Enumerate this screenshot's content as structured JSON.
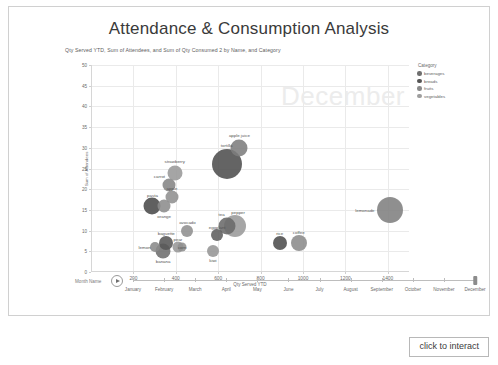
{
  "report": {
    "title": "Attendance & Consumption Analysis",
    "subtitle": "Qty Served YTD, Sum of Attendees, and Sum of Qty Consumed 2 by Name, and Category",
    "click_to_interact_label": "click to interact",
    "watermark": "December"
  },
  "legend": {
    "title": "Category",
    "position": "right",
    "items": [
      {
        "label": "beverages",
        "color": "#6f6f6f"
      },
      {
        "label": "breads",
        "color": "#555555"
      },
      {
        "label": "fruits",
        "color": "#8a8a8a"
      },
      {
        "label": "vegetables",
        "color": "#9e9e9e"
      }
    ]
  },
  "play_axis": {
    "field_label": "Month Name",
    "play_icon": "play-icon",
    "selected": "December",
    "months": [
      "January",
      "February",
      "March",
      "April",
      "May",
      "June",
      "July",
      "August",
      "September",
      "October",
      "November",
      "December"
    ]
  },
  "chart_data": {
    "type": "scatter",
    "title": "Attendance & Consumption Analysis",
    "subtitle": "Qty Served YTD, Sum of Attendees, and Sum of Qty Consumed 2 by Name, and Category",
    "xlabel": "Qty Served YTD",
    "ylabel": "Sum of Attendees",
    "size_label": "Sum of Qty Consumed 2",
    "xlim": [
      0,
      1500
    ],
    "ylim": [
      0,
      50
    ],
    "xticks": [
      200,
      400,
      600,
      800,
      1000,
      1200,
      1400
    ],
    "yticks": [
      0,
      5,
      10,
      15,
      20,
      25,
      30,
      35,
      40,
      45,
      50
    ],
    "grid": true,
    "legend_position": "right",
    "points": [
      {
        "name": "apple juice",
        "category": "beverages",
        "x": 700,
        "y": 30,
        "size": 17,
        "color": "#7d7d7d",
        "label_dx": 0,
        "label_dy": -13
      },
      {
        "name": "tortilla",
        "category": "breads",
        "x": 640,
        "y": 26,
        "size": 30,
        "color": "#4e4e4e",
        "label_dx": 0,
        "label_dy": -19
      },
      {
        "name": "strawberry",
        "category": "fruits",
        "x": 395,
        "y": 24,
        "size": 15,
        "color": "#999999",
        "label_dx": 0,
        "label_dy": -12
      },
      {
        "name": "carrot",
        "category": "vegetables",
        "x": 370,
        "y": 21,
        "size": 13,
        "color": "#858585",
        "label_dx": -10,
        "label_dy": -9
      },
      {
        "name": "apple",
        "category": "fruits",
        "x": 382,
        "y": 18,
        "size": 13,
        "color": "#8f8f8f",
        "label_dx": 0,
        "label_dy": -9
      },
      {
        "name": "pasta",
        "category": "breads",
        "x": 290,
        "y": 16,
        "size": 17,
        "color": "#4a4a4a",
        "label_dx": 0,
        "label_dy": -11
      },
      {
        "name": "orange",
        "category": "fruits",
        "x": 345,
        "y": 16,
        "size": 13,
        "color": "#8c8c8c",
        "label_dx": 0,
        "label_dy": 10
      },
      {
        "name": "lemonade",
        "category": "beverages",
        "x": 1410,
        "y": 15,
        "size": 26,
        "color": "#808080",
        "label_dx": -25,
        "label_dy": 0
      },
      {
        "name": "pepper",
        "category": "vegetables",
        "x": 680,
        "y": 11,
        "size": 22,
        "color": "#9a9a9a",
        "label_dx": 3,
        "label_dy": -14
      },
      {
        "name": "tea",
        "category": "beverages",
        "x": 640,
        "y": 11,
        "size": 17,
        "color": "#6a6a6a",
        "label_dx": -5,
        "label_dy": -12
      },
      {
        "name": "avocado",
        "category": "vegetables",
        "x": 455,
        "y": 10,
        "size": 12,
        "color": "#909090",
        "label_dx": 0,
        "label_dy": -9
      },
      {
        "name": "eggplant",
        "category": "vegetables",
        "x": 595,
        "y": 9,
        "size": 12,
        "color": "#5e5e5e",
        "label_dx": 0,
        "label_dy": -8
      },
      {
        "name": "rice",
        "category": "breads",
        "x": 890,
        "y": 7,
        "size": 14,
        "color": "#4d4d4d",
        "label_dx": 0,
        "label_dy": -10
      },
      {
        "name": "coffee",
        "category": "beverages",
        "x": 980,
        "y": 7,
        "size": 16,
        "color": "#8b8b8b",
        "label_dx": 0,
        "label_dy": -11
      },
      {
        "name": "baguette",
        "category": "breads",
        "x": 355,
        "y": 7,
        "size": 14,
        "color": "#575757",
        "label_dx": 0,
        "label_dy": -10
      },
      {
        "name": "pear",
        "category": "fruits",
        "x": 410,
        "y": 6,
        "size": 11,
        "color": "#979797",
        "label_dx": 0,
        "label_dy": -8
      },
      {
        "name": "lemon",
        "category": "fruits",
        "x": 300,
        "y": 6,
        "size": 10,
        "color": "#8a8a8a",
        "label_dx": -10,
        "label_dy": 0
      },
      {
        "name": "banana",
        "category": "fruits",
        "x": 340,
        "y": 5,
        "size": 15,
        "color": "#6e6e6e",
        "label_dx": 0,
        "label_dy": 10
      },
      {
        "name": "kiwi",
        "category": "fruits",
        "x": 575,
        "y": 5,
        "size": 12,
        "color": "#959595",
        "label_dx": 0,
        "label_dy": 9
      },
      {
        "name": "corn",
        "category": "vegetables",
        "x": 430,
        "y": 6,
        "size": 9,
        "color": "#8f8f8f",
        "label_dx": 0,
        "label_dy": 0
      }
    ]
  }
}
